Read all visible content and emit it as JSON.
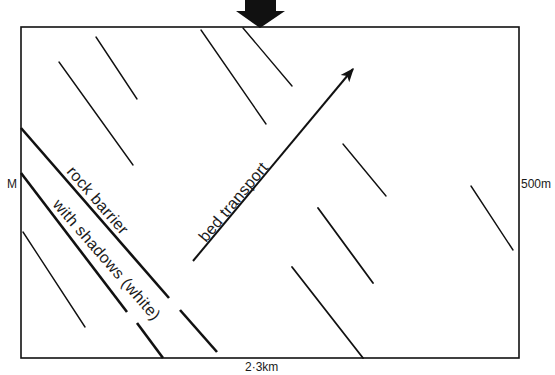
{
  "diagram": {
    "type": "map-schematic",
    "colors": {
      "ink": "#111111",
      "background": "#ffffff"
    },
    "frame": {
      "x": 21,
      "y": 27,
      "width": 498,
      "height": 331
    },
    "labels": {
      "left_marker": "M",
      "right_scale": "500m",
      "bottom_scale": "2·3km",
      "barrier_line1": "rock barrier",
      "barrier_line2": "with shadows (white)",
      "transport": "bed transport"
    },
    "flow_arrow": {
      "icon": "down-arrow-icon",
      "description": "Incoming flow indicator at top of frame"
    },
    "transport_arrow": {
      "icon": "arrow-icon",
      "from": [
        193,
        261
      ],
      "to": [
        353,
        69
      ]
    },
    "bedforms": [
      {
        "id": "A",
        "from": [
          59,
          62
        ],
        "to": [
          133,
          165
        ]
      },
      {
        "id": "B",
        "from": [
          96,
          37
        ],
        "to": [
          137,
          99
        ]
      },
      {
        "id": "C",
        "from": [
          201,
          30
        ],
        "to": [
          266,
          124
        ]
      },
      {
        "id": "D",
        "from": [
          243,
          28
        ],
        "to": [
          292,
          86
        ]
      },
      {
        "id": "E",
        "from": [
          343,
          144
        ],
        "to": [
          386,
          196
        ]
      },
      {
        "id": "F",
        "from": [
          318,
          208
        ],
        "to": [
          373,
          283
        ]
      },
      {
        "id": "G",
        "from": [
          292,
          267
        ],
        "to": [
          363,
          358
        ]
      },
      {
        "id": "H",
        "from": [
          471,
          186
        ],
        "to": [
          513,
          250
        ]
      },
      {
        "id": "I",
        "from": [
          23,
          232
        ],
        "to": [
          85,
          327
        ]
      }
    ],
    "barrier_lines": [
      {
        "id": "upper-1",
        "from": [
          21,
          128
        ],
        "to": [
          169,
          298
        ]
      },
      {
        "id": "upper-2",
        "from": [
          180,
          310
        ],
        "to": [
          217,
          352
        ]
      },
      {
        "id": "lower-1",
        "from": [
          21,
          173
        ],
        "to": [
          127,
          312
        ]
      },
      {
        "id": "lower-2",
        "from": [
          137,
          323
        ],
        "to": [
          163,
          358
        ]
      }
    ]
  }
}
